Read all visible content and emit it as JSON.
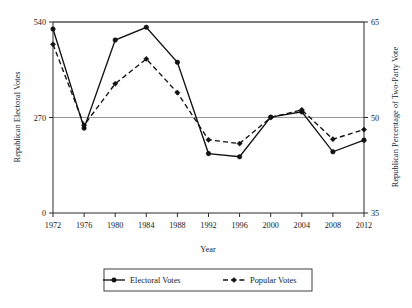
{
  "chart_data": {
    "type": "line",
    "title": "",
    "xlabel": "Year",
    "ylabel": "Republican Electoral Votes",
    "y2label": "Republican Percentage of Two-Party Vote",
    "categories": [
      1972,
      1976,
      1980,
      1984,
      1988,
      1992,
      1996,
      2000,
      2004,
      2008,
      2012
    ],
    "xtick_labels": [
      "1972",
      "1976",
      "1980",
      "1984",
      "1988",
      "1992",
      "1996",
      "2000",
      "2004",
      "2008",
      "2012"
    ],
    "ylim": [
      0,
      540
    ],
    "ytick_labels": [
      "0",
      "270",
      "540"
    ],
    "ytick_values": [
      0,
      270,
      540
    ],
    "y2lim": [
      35,
      65
    ],
    "y2tick_labels": [
      "35",
      "50",
      "65"
    ],
    "y2tick_values": [
      35,
      50,
      65
    ],
    "grid": true,
    "gridlines_at": [
      270,
      540
    ],
    "legend_position": "bottom",
    "series": [
      {
        "name": "Electoral Votes",
        "axis": "left",
        "style": "solid",
        "marker": "filled-circle",
        "values": [
          520,
          240,
          489,
          525,
          426,
          168,
          159,
          271,
          286,
          173,
          206
        ]
      },
      {
        "name": "Popular Votes",
        "axis": "right",
        "style": "dashed",
        "marker": "filled-diamond",
        "values": [
          61.5,
          48.8,
          55.3,
          59.2,
          53.9,
          46.5,
          45.9,
          50.0,
          51.2,
          46.6,
          48.1
        ]
      }
    ]
  },
  "legend": {
    "items": [
      {
        "label": "Electoral Votes",
        "style": "solid"
      },
      {
        "label": "Popular Votes",
        "style": "dashed"
      }
    ]
  },
  "colors": {
    "ink": "#111111",
    "axis": "#2b2b2b",
    "grid": "#8a8a8a",
    "background": "#ffffff"
  }
}
